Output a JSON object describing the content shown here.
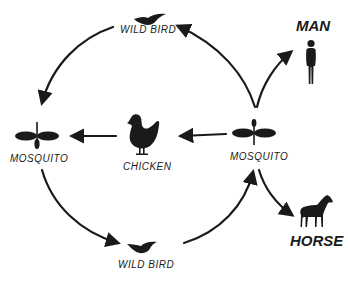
{
  "diagram": {
    "type": "transmission-cycle",
    "nodes": [
      {
        "id": "wild-bird-top",
        "label": "WILD BIRD",
        "icon": "bird-icon"
      },
      {
        "id": "mosquito-left",
        "label": "MOSQUITO",
        "icon": "mosquito-icon"
      },
      {
        "id": "chicken",
        "label": "CHICKEN",
        "icon": "chicken-icon"
      },
      {
        "id": "mosquito-right",
        "label": "MOSQUITO",
        "icon": "mosquito-icon"
      },
      {
        "id": "wild-bird-bottom",
        "label": "WILD BIRD",
        "icon": "bird-icon"
      },
      {
        "id": "man",
        "label": "MAN",
        "icon": "person-icon"
      },
      {
        "id": "horse",
        "label": "HORSE",
        "icon": "horse-icon"
      }
    ],
    "edges": [
      {
        "from": "wild-bird-top",
        "to": "mosquito-left"
      },
      {
        "from": "mosquito-left",
        "to": "wild-bird-bottom"
      },
      {
        "from": "wild-bird-bottom",
        "to": "mosquito-right"
      },
      {
        "from": "mosquito-right",
        "to": "wild-bird-top"
      },
      {
        "from": "mosquito-right",
        "to": "chicken"
      },
      {
        "from": "chicken",
        "to": "mosquito-left"
      },
      {
        "from": "mosquito-right",
        "to": "man"
      },
      {
        "from": "mosquito-right",
        "to": "horse"
      }
    ]
  },
  "labels": {
    "wild_bird_top": "WILD BIRD",
    "mosquito_left": "MOSQUITO",
    "chicken": "CHICKEN",
    "mosquito_right": "MOSQUITO",
    "wild_bird_bottom": "WILD BIRD",
    "man": "MAN",
    "horse": "HORSE"
  },
  "colors": {
    "ink": "#1a1a1a",
    "background": "#ffffff"
  }
}
